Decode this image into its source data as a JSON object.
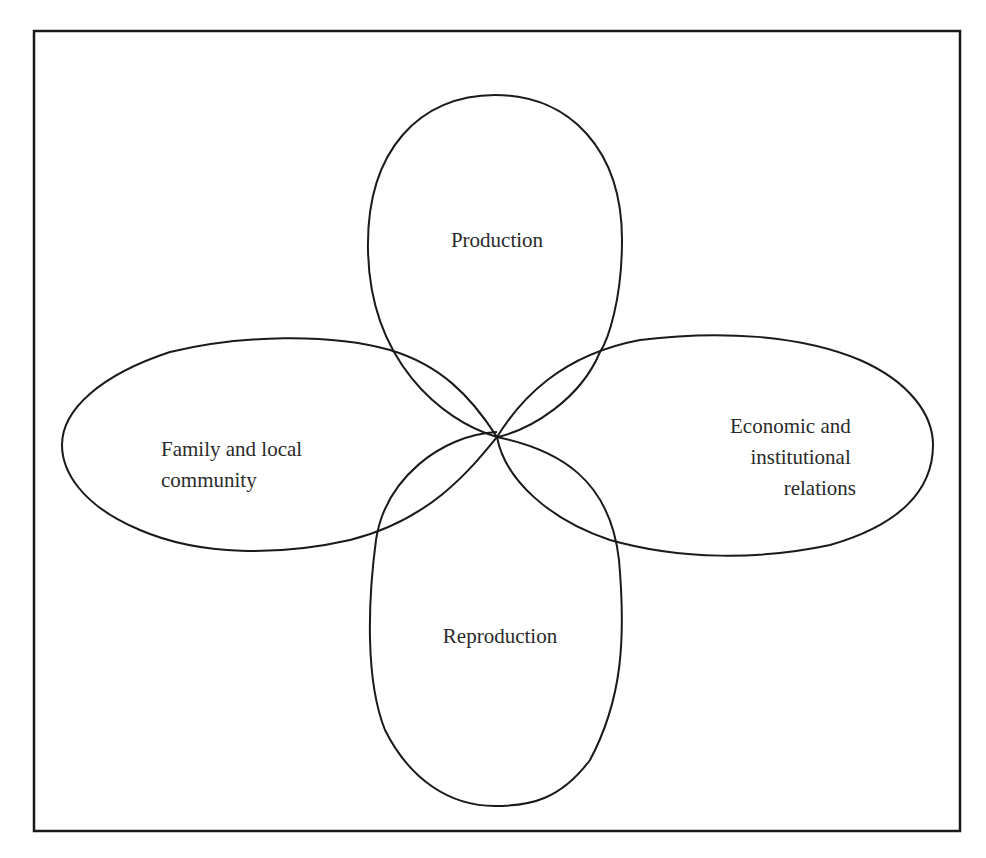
{
  "diagram": {
    "type": "four-petal overlapping loops",
    "frame": {
      "stroke": "#1a1a1a"
    },
    "petals": [
      {
        "id": "top",
        "label_lines": [
          "Production"
        ]
      },
      {
        "id": "left",
        "label_lines": [
          "Family and local",
          "community"
        ]
      },
      {
        "id": "right",
        "label_lines": [
          "Economic and",
          "institutional",
          "relations"
        ]
      },
      {
        "id": "bottom",
        "label_lines": [
          "Reproduction"
        ]
      }
    ]
  }
}
